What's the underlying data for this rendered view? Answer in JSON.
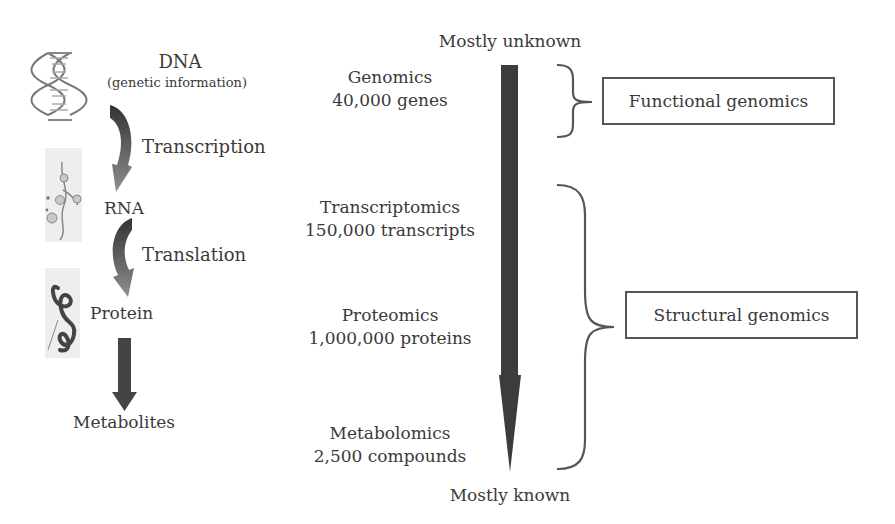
{
  "left_flow": {
    "dna": {
      "title": "DNA",
      "subtitle": "(genetic information)",
      "icon": "dna-helix-icon"
    },
    "transcription": {
      "label": "Transcription",
      "icon": "curved-arrow-icon"
    },
    "rna": {
      "title": "RNA",
      "icon": "rna-strand-icon"
    },
    "translation": {
      "label": "Translation",
      "icon": "curved-arrow-icon"
    },
    "protein": {
      "title": "Protein",
      "icon": "protein-fold-icon"
    },
    "metabolites": {
      "title": "Metabolites",
      "icon": "down-arrow-icon"
    }
  },
  "middle": {
    "top_label": "Mostly unknown",
    "bottom_label": "Mostly known",
    "levels": [
      {
        "name": "Genomics",
        "count": "40,000 genes"
      },
      {
        "name": "Transcriptomics",
        "count": "150,000 transcripts"
      },
      {
        "name": "Proteomics",
        "count": "1,000,000 proteins"
      },
      {
        "name": "Metabolomics",
        "count": "2,500 compounds"
      }
    ]
  },
  "right": {
    "functional": "Functional genomics",
    "structural": "Structural genomics"
  },
  "colors": {
    "arrow_dark": "#3c3c3c",
    "arrow_gradient_end": "#8a8a8a",
    "text": "#3a3a3a",
    "box_border": "#555555"
  }
}
